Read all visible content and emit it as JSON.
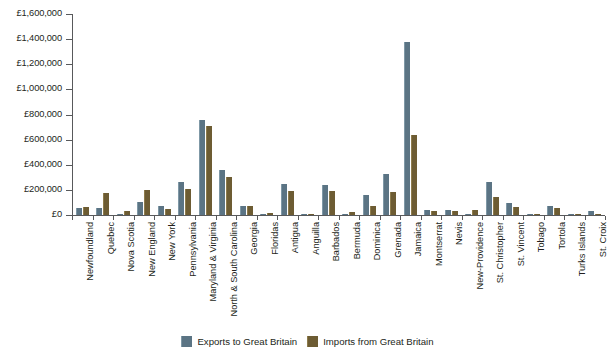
{
  "chart_data": {
    "type": "bar",
    "title": "",
    "subtitle": "",
    "xlabel": "",
    "ylabel": "",
    "ylim": [
      0,
      1600000
    ],
    "ytick_values": [
      0,
      200000,
      400000,
      600000,
      800000,
      1000000,
      1200000,
      1400000,
      1600000
    ],
    "ytick_labels": [
      "£0",
      "£200,000",
      "£400,000",
      "£600,000",
      "£800,000",
      "£1,000,000",
      "£1,200,000",
      "£1,400,000",
      "£1,600,000"
    ],
    "currency_symbol": "£",
    "grid": false,
    "legend_position": "bottom",
    "categories": [
      "Newfoundland",
      "Quebec",
      "Nova Scotia",
      "New England",
      "New York",
      "Pennsylvania",
      "Maryland & Virginia",
      "North & South Carolina",
      "Georgia",
      "Floridas",
      "Antigua",
      "Anguilla",
      "Barbados",
      "Bermuda",
      "Dominica",
      "Grenada",
      "Jamaica",
      "Montserrat",
      "Nevis",
      "New-Providence",
      "St. Christopher",
      "St. Vincent",
      "Tobago",
      "Tortola",
      "Turks Islands",
      "St. Croix"
    ],
    "series": [
      {
        "name": "Exports to Great Britain",
        "color": "#5b7484",
        "values": [
          52000,
          55000,
          10000,
          100000,
          70000,
          260000,
          760000,
          360000,
          72000,
          8000,
          245000,
          4000,
          240000,
          12000,
          160000,
          325000,
          1380000,
          42000,
          40000,
          12000,
          260000,
          95000,
          8000,
          75000,
          5000,
          28000
        ]
      },
      {
        "name": "Imports from Great Britain",
        "color": "#6d5c33",
        "values": [
          62000,
          175000,
          35000,
          200000,
          45000,
          205000,
          710000,
          305000,
          70000,
          18000,
          188000,
          3000,
          190000,
          26000,
          72000,
          185000,
          640000,
          28000,
          30000,
          42000,
          140000,
          60000,
          4000,
          55000,
          2000,
          12000
        ]
      }
    ]
  },
  "legend": {
    "items": [
      {
        "label": "Exports to Great Britain",
        "swatch": "exports"
      },
      {
        "label": "Imports from Great Britain",
        "swatch": "imports"
      }
    ]
  }
}
